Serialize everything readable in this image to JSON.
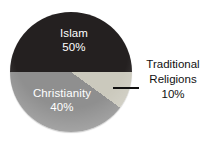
{
  "chart_data": {
    "type": "pie",
    "title": "",
    "legend_position": "none",
    "start_angle_deg": 270,
    "slices": [
      {
        "label": "Islam",
        "pct_label": "50%",
        "value": 50,
        "color": "#242020",
        "text_color": "#ffffff"
      },
      {
        "label": "Traditional Religions",
        "pct_label": "10%",
        "value": 10,
        "color": "#cbc9bd",
        "text_color": "#111111"
      },
      {
        "label": "Christianity",
        "pct_label": "40%",
        "value": 40,
        "color": "#8f8f8f",
        "text_color": "#ffffff"
      }
    ],
    "callout": {
      "slice_index": 1,
      "side": "right"
    }
  }
}
